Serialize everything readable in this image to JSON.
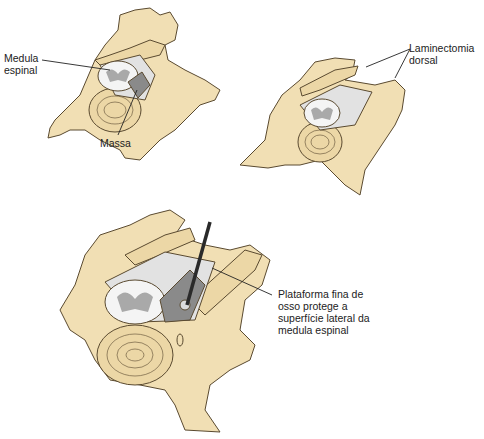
{
  "figure": {
    "panels": [
      {
        "id": "top-left",
        "description": "Vertebra with mass compressing spinal cord",
        "labels": {
          "spinal_cord": "Medula\nespinal",
          "mass": "Massa"
        }
      },
      {
        "id": "top-right",
        "description": "Vertebra after dorsal laminectomy",
        "labels": {
          "laminectomy": "Laminectomia\ndorsal"
        }
      },
      {
        "id": "bottom",
        "description": "Vertebra with instrument removing mass; thin bone shelf",
        "labels": {
          "bone_shelf": "Plataforma fina de\nosso protege a\nsuperfície lateral da\nmedula espinal"
        }
      }
    ],
    "colors": {
      "bone": "#f1dfb4",
      "bone_outline": "#5a4a30",
      "cord_white": "#f4f4f4",
      "cord_gray": "#a9a9a9",
      "cord_dark": "#8a8a8a",
      "line": "#222222"
    }
  }
}
